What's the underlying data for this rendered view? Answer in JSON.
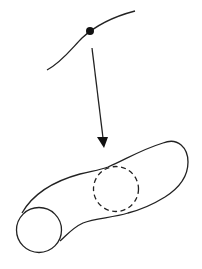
{
  "diagram": {
    "elements": [
      {
        "id": "curve",
        "kind": "curve"
      },
      {
        "id": "point",
        "kind": "marked-point",
        "on": "curve"
      },
      {
        "id": "arrow",
        "kind": "arrow",
        "from": "point",
        "to": "tube"
      },
      {
        "id": "tube",
        "kind": "tube-surface"
      },
      {
        "id": "end-cap",
        "kind": "circle",
        "style": "solid"
      },
      {
        "id": "cross-section",
        "kind": "circle",
        "style": "dashed"
      }
    ],
    "colors": {
      "stroke": "#222222",
      "background": "#ffffff"
    }
  }
}
